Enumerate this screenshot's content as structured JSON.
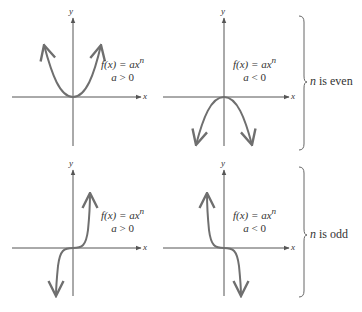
{
  "colors": {
    "curve": "#6f6f6f",
    "axis": "#555555",
    "text": "#333333"
  },
  "panels": [
    {
      "id": "even-pos",
      "func": "f(x) = ax",
      "exp": "n",
      "cond_var": "a",
      "cond": "> 0",
      "x_label": "x",
      "y_label": "y"
    },
    {
      "id": "even-neg",
      "func": "f(x) = ax",
      "exp": "n",
      "cond_var": "a",
      "cond": "< 0",
      "x_label": "x",
      "y_label": "y"
    },
    {
      "id": "odd-pos",
      "func": "f(x) = ax",
      "exp": "n",
      "cond_var": "a",
      "cond": "> 0",
      "x_label": "x",
      "y_label": "y"
    },
    {
      "id": "odd-neg",
      "func": "f(x) = ax",
      "exp": "n",
      "cond_var": "a",
      "cond": "< 0",
      "x_label": "x",
      "y_label": "y"
    }
  ],
  "brackets": [
    {
      "var": "n",
      "text": " is even"
    },
    {
      "var": "n",
      "text": " is odd"
    }
  ]
}
